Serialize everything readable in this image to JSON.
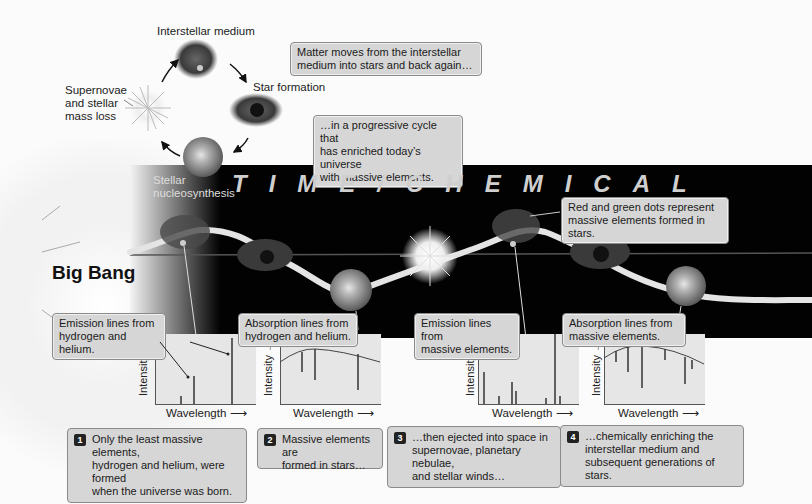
{
  "cycle": {
    "interstellar_medium": "Interstellar medium",
    "star_formation": "Star formation",
    "stellar_nucleosynthesis_line1": "Stellar",
    "stellar_nucleosynthesis_line2": "nucleosynthesis",
    "supernovae_line1": "Supernovae",
    "supernovae_line2": "and stellar",
    "supernovae_line3": "mass loss"
  },
  "callouts": {
    "matter_moves_line1": "Matter moves from the interstellar",
    "matter_moves_line2": "medium into stars and back again…",
    "progressive_line1": "…in a progressive cycle that",
    "progressive_line2": "has enriched today’s universe",
    "progressive_line3": "with massive elements.",
    "dots_line1": "Red and green dots represent",
    "dots_line2": "massive elements formed in stars."
  },
  "timeline": {
    "title": "TIME/CHEMICAL",
    "big_bang": "Big Bang"
  },
  "spectra": [
    {
      "label_line1": "Emission lines from",
      "label_line2": "hydrogen and helium.",
      "y_axis": "Intensity",
      "x_axis": "Wavelength",
      "type": "emission"
    },
    {
      "label_line1": "Absorption lines from",
      "label_line2": "hydrogen and helium.",
      "y_axis": "Intensity",
      "x_axis": "Wavelength",
      "type": "absorption"
    },
    {
      "label_line1": "Emission lines from",
      "label_line2": "massive elements.",
      "y_axis": "Intensity",
      "x_axis": "Wavelength",
      "type": "emission"
    },
    {
      "label_line1": "Absorption lines from",
      "label_line2": "massive elements.",
      "y_axis": "Intensity",
      "x_axis": "Wavelength",
      "type": "absorption"
    }
  ],
  "steps": [
    {
      "number": "1",
      "line1": "Only the least massive elements,",
      "line2": "hydrogen and helium, were formed",
      "line3": "when the universe was born."
    },
    {
      "number": "2",
      "line1": "Massive elements are",
      "line2": "formed in stars…",
      "line3": ""
    },
    {
      "number": "3",
      "line1": "…then ejected into space in",
      "line2": "supernovae, planetary nebulae,",
      "line3": "and stellar winds…"
    },
    {
      "number": "4",
      "line1": "…chemically enriching the",
      "line2": "interstellar medium and",
      "line3": "subsequent generations of stars."
    }
  ],
  "colors": {
    "band": "#020202",
    "box_fill": "#d6d6d6",
    "box_border": "#8a8a8a",
    "panel_fill": "#e6e6e6"
  }
}
